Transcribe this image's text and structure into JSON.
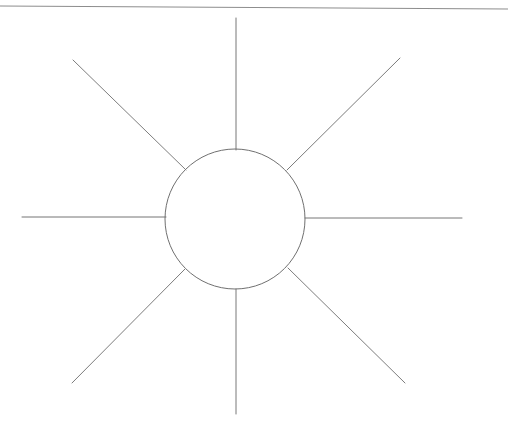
{
  "page": {
    "title": "Hand-drawn sun diagram",
    "width": 508,
    "height": 424,
    "background_color": "#ffffff",
    "ink_color": "#6b6b6b",
    "rule_color": "#8a8a8a"
  },
  "drawing": {
    "name": "sun-diagram",
    "description": "Circle with eight radiating straight rays, drawn in pencil on white paper",
    "center": {
      "x": 235,
      "y": 219
    },
    "circle": {
      "name": "sun-core-circle",
      "radius": 70,
      "stroke_width": 1,
      "color": "#6f6f6f"
    },
    "rays": [
      {
        "name": "ray-north",
        "label": "North",
        "angle_deg": 270,
        "inner_radius": 70,
        "outer_x": 236,
        "outer_y": 18,
        "inner_x": 236,
        "inner_y": 150,
        "color": "#767676"
      },
      {
        "name": "ray-northeast",
        "label": "North-East",
        "angle_deg": 315,
        "inner_radius": 70,
        "outer_x": 400,
        "outer_y": 58,
        "inner_x": 287,
        "inner_y": 170,
        "color": "#7a7a7a"
      },
      {
        "name": "ray-east",
        "label": "East",
        "angle_deg": 0,
        "inner_radius": 70,
        "outer_x": 462,
        "outer_y": 218,
        "inner_x": 305,
        "inner_y": 218,
        "color": "#777777"
      },
      {
        "name": "ray-southeast",
        "label": "South-East",
        "angle_deg": 45,
        "inner_radius": 70,
        "outer_x": 405,
        "outer_y": 383,
        "inner_x": 288,
        "inner_y": 268,
        "color": "#7c7c7c"
      },
      {
        "name": "ray-south",
        "label": "South",
        "angle_deg": 90,
        "inner_radius": 70,
        "outer_x": 236,
        "outer_y": 414,
        "inner_x": 236,
        "inner_y": 289,
        "color": "#787878"
      },
      {
        "name": "ray-southwest",
        "label": "South-West",
        "angle_deg": 135,
        "inner_radius": 70,
        "outer_x": 72,
        "outer_y": 383,
        "inner_x": 185,
        "inner_y": 269,
        "color": "#7b7b7b"
      },
      {
        "name": "ray-west",
        "label": "West",
        "angle_deg": 180,
        "inner_radius": 70,
        "outer_x": 22,
        "outer_y": 217,
        "inner_x": 166,
        "inner_y": 217,
        "color": "#757575"
      },
      {
        "name": "ray-northwest",
        "label": "North-West",
        "angle_deg": 225,
        "inner_radius": 70,
        "outer_x": 73,
        "outer_y": 60,
        "inner_x": 186,
        "inner_y": 170,
        "color": "#7d7d7d"
      }
    ],
    "ray_count": 8
  },
  "rules": [
    {
      "name": "top-horizontal-rule",
      "x1": 0,
      "y1": 6,
      "x2": 508,
      "y2": 9,
      "color": "#8d8d8d",
      "stroke_width": 1.2
    }
  ],
  "accessibility": {
    "figure_alt": "A pencil sketch of a sun: one circle at the centre with eight straight lines radiating outward at 45 degree intervals.",
    "caption": ""
  }
}
